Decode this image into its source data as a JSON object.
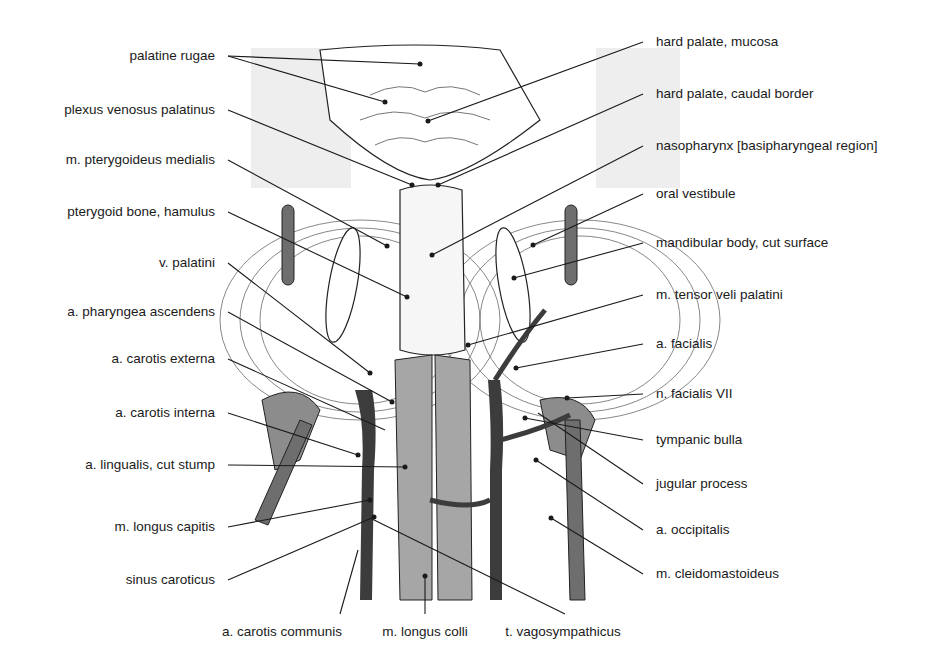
{
  "figure": {
    "colors": {
      "background": "#ffffff",
      "panel_gray": "#eeeeee",
      "muscle_gray": "#a6a6a6",
      "vessel_dark": "#3c3c3c",
      "vessel_mid": "#6e6e6e",
      "gland_gray": "#8c8c8c",
      "line": "#1a1a1a"
    },
    "labels_left": [
      {
        "text": "palatine rugae",
        "x": 215,
        "y": 56
      },
      {
        "text": "plexus venosus palatinus",
        "x": 215,
        "y": 110
      },
      {
        "text": "m. pterygoideus medialis",
        "x": 215,
        "y": 160
      },
      {
        "text": "pterygoid bone, hamulus",
        "x": 215,
        "y": 212
      },
      {
        "text": "v. palatini",
        "x": 215,
        "y": 263
      },
      {
        "text": "a. pharyngea ascendens",
        "x": 215,
        "y": 312
      },
      {
        "text": "a. carotis externa",
        "x": 215,
        "y": 359
      },
      {
        "text": "a. carotis interna",
        "x": 215,
        "y": 413
      },
      {
        "text": "a. lingualis, cut stump",
        "x": 215,
        "y": 465
      },
      {
        "text": "m. longus capitis",
        "x": 215,
        "y": 527
      },
      {
        "text": "sinus caroticus",
        "x": 215,
        "y": 580
      }
    ],
    "labels_right": [
      {
        "text": "hard palate, mucosa",
        "x": 656,
        "y": 42
      },
      {
        "text": "hard palate, caudal border",
        "x": 656,
        "y": 94
      },
      {
        "text": "nasopharynx [basipharyngeal region]",
        "x": 656,
        "y": 146
      },
      {
        "text": "oral vestibule",
        "x": 656,
        "y": 194
      },
      {
        "text": "mandibular body, cut surface",
        "x": 656,
        "y": 243
      },
      {
        "text": "m. tensor veli palatini",
        "x": 656,
        "y": 295
      },
      {
        "text": "a. facialis",
        "x": 656,
        "y": 344
      },
      {
        "text": "n. facialis VII",
        "x": 656,
        "y": 394
      },
      {
        "text": "tympanic bulla",
        "x": 656,
        "y": 440
      },
      {
        "text": "jugular process",
        "x": 656,
        "y": 484
      },
      {
        "text": "a. occipitalis",
        "x": 656,
        "y": 530
      },
      {
        "text": "m. cleidomastoideus",
        "x": 656,
        "y": 574
      }
    ],
    "labels_bottom": [
      {
        "text": "a. carotis communis",
        "x": 282,
        "y": 626
      },
      {
        "text": "m. longus colli",
        "x": 425,
        "y": 626
      },
      {
        "text": "t. vagosympathicus",
        "x": 563,
        "y": 626
      }
    ]
  }
}
